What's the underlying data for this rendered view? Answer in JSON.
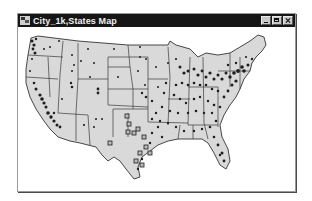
{
  "window": {
    "title": "City_1k,States Map",
    "controls": {
      "minimize": "minimize",
      "maximize": "maximize",
      "close": "close"
    }
  },
  "map": {
    "layers": [
      "City_1k",
      "States"
    ],
    "region": "Contiguous United States",
    "state_fill": "#d9d9d9",
    "state_border": "#3a3a3a",
    "city_point_color": "#1e1e1e",
    "selected_marker_style": "square outline",
    "icons": {
      "app": "map-document-icon",
      "city": "city-point-icon",
      "selected_city": "square-marker-icon"
    }
  },
  "colors": {
    "titlebar": "#161616",
    "title_text": "#f0f0f0",
    "window_bg": "#ffffff"
  }
}
